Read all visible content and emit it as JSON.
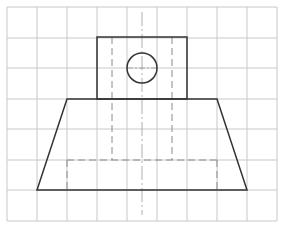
{
  "diagram": {
    "type": "orthographic-view-on-grid",
    "colors": {
      "background": "#ffffff",
      "grid": "#c8c8c8",
      "outline": "#333333",
      "hidden": "#8a8a8a",
      "centerline": "#9a9a9a"
    },
    "grid": {
      "x_lines": [
        7,
        37,
        67,
        97,
        127,
        157,
        187,
        217,
        247,
        277
      ],
      "y_lines": [
        7,
        38,
        68,
        99,
        129,
        160,
        190,
        221
      ],
      "columns": 9,
      "rows": 7
    },
    "shapes": {
      "top_rectangle": {
        "x1": 97,
        "y1": 37,
        "x2": 187,
        "y2": 99
      },
      "hole_circle": {
        "cx": 142,
        "cy": 68,
        "r": 15
      },
      "base_trapezoid": {
        "points": [
          [
            67,
            99
          ],
          [
            217,
            99
          ],
          [
            247,
            190
          ],
          [
            37,
            190
          ]
        ]
      }
    },
    "hidden_lines": [
      {
        "x1": 112,
        "y1": 37,
        "x2": 112,
        "y2": 160
      },
      {
        "x1": 172,
        "y1": 37,
        "x2": 172,
        "y2": 160
      },
      {
        "x1": 67,
        "y1": 160,
        "x2": 217,
        "y2": 160
      },
      {
        "x1": 67,
        "y1": 160,
        "x2": 67,
        "y2": 190
      },
      {
        "x1": 217,
        "y1": 160,
        "x2": 217,
        "y2": 190
      }
    ],
    "center_line": {
      "x1": 142,
      "y1": 12,
      "x2": 142,
      "y2": 215
    },
    "circle_center_mark": {
      "x1": 127,
      "y1": 68,
      "x2": 157,
      "y2": 68
    }
  }
}
